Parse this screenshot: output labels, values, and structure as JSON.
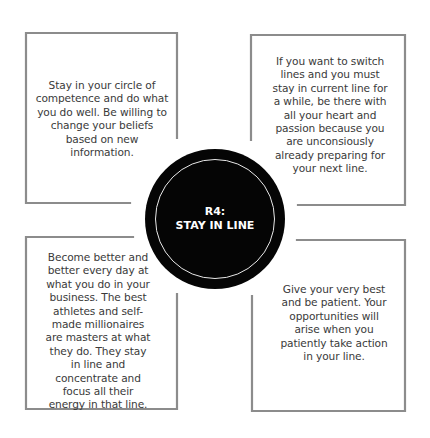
{
  "center": {
    "line1": "R4:",
    "line2": "STAY IN LINE",
    "fill_color": "#050505",
    "ring_color": "#e8e8e8"
  },
  "boxes": [
    {
      "position": "top-left",
      "text": "Stay in your circle of competence and do what you do well. Be willing to change your beliefs based on new information."
    },
    {
      "position": "top-right",
      "text": "If you want to switch lines and you must stay in current line for a while, be there with all your heart and passion because you are unconsiously already preparing for your next line."
    },
    {
      "position": "bottom-left",
      "text": "Become better and better every day at what you do in your business. The best athletes and self-made millionaires are masters at what they do. They stay in line and concentrate and focus all their energy in that line."
    },
    {
      "position": "bottom-right",
      "text": "Give your very best and be patient. Your opportunities will arise when you patiently take action in your line."
    }
  ],
  "colors": {
    "border": "#8c8c8c",
    "text": "#3a3a3a",
    "background": "#ffffff"
  }
}
